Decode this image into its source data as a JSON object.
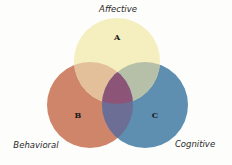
{
  "diagram": {
    "type": "venn",
    "sets": [
      {
        "id": "A",
        "name": "Affective",
        "letter": "A",
        "color": "#f5eebe",
        "cx": 117,
        "cy": 61,
        "r": 43
      },
      {
        "id": "B",
        "name": "Behavioral",
        "letter": "B",
        "color": "#cf856a",
        "cx": 90,
        "cy": 105,
        "r": 43
      },
      {
        "id": "C",
        "name": "Cognitive",
        "letter": "C",
        "color": "#5e8eb0",
        "cx": 145,
        "cy": 105,
        "r": 43
      }
    ],
    "overlap_colors": {
      "AB": "#e3c09a",
      "AC": "#b6bfa7",
      "BC": "#6c6e95",
      "ABC": "#8c5578"
    }
  },
  "labels": {
    "affective": "Affective",
    "behavioral": "Behavioral",
    "cognitive": "Cognitive",
    "a": "A",
    "b": "B",
    "c": "C"
  }
}
